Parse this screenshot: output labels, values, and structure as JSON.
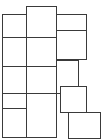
{
  "figure": {
    "background_color": "#ffffff",
    "stroke_color": "#3a3a3a",
    "fill_color": "#ffffff",
    "stroke_width": 1.5,
    "canvas": {
      "width": 103,
      "height": 139
    },
    "tiles": [
      {
        "name": "tile-top-center",
        "x": 26,
        "y": 6,
        "w": 31,
        "h": 32
      },
      {
        "name": "tile-top-left",
        "x": 2,
        "y": 14,
        "w": 25,
        "h": 24
      },
      {
        "name": "tile-top-right",
        "x": 56,
        "y": 14,
        "w": 31,
        "h": 24
      },
      {
        "name": "tile-mid-left",
        "x": 2,
        "y": 37,
        "w": 25,
        "h": 30
      },
      {
        "name": "tile-mid-center",
        "x": 26,
        "y": 37,
        "w": 31,
        "h": 30
      },
      {
        "name": "tile-mid-right",
        "x": 56,
        "y": 30,
        "w": 31,
        "h": 30
      },
      {
        "name": "tile-row3-left",
        "x": 2,
        "y": 66,
        "w": 25,
        "h": 28
      },
      {
        "name": "tile-row3-center",
        "x": 26,
        "y": 66,
        "w": 31,
        "h": 28
      },
      {
        "name": "tile-row3-right",
        "x": 56,
        "y": 60,
        "w": 23,
        "h": 34
      },
      {
        "name": "tile-row4-left",
        "x": 2,
        "y": 93,
        "w": 25,
        "h": 16
      },
      {
        "name": "tile-row4-center",
        "x": 26,
        "y": 93,
        "w": 31,
        "h": 45
      },
      {
        "name": "tile-row4-right",
        "x": 60,
        "y": 86,
        "w": 27,
        "h": 27
      },
      {
        "name": "tile-bottom-left",
        "x": 2,
        "y": 108,
        "w": 25,
        "h": 30
      },
      {
        "name": "tile-bottom-right",
        "x": 68,
        "y": 112,
        "w": 33,
        "h": 27
      }
    ]
  }
}
